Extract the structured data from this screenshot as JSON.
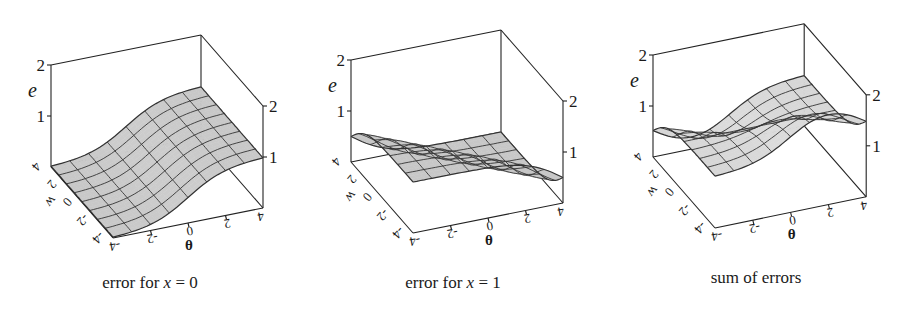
{
  "figure": {
    "panels": [
      {
        "caption_prefix": "error for ",
        "caption_var": "x",
        "caption_suffix": " = 0"
      },
      {
        "caption_prefix": "error for ",
        "caption_var": "x",
        "caption_suffix": " = 1"
      },
      {
        "caption_prefix": "sum of errors",
        "caption_var": "",
        "caption_suffix": ""
      }
    ]
  },
  "chart_data": [
    {
      "type": "surface",
      "title": "error for x = 0",
      "xlabel": "θ",
      "ylabel": "w",
      "zlabel": "e",
      "x_ticks": [
        -4,
        -2,
        0,
        2,
        4
      ],
      "y_ticks": [
        -4,
        -2,
        0,
        2,
        4
      ],
      "z_ticks": [
        1,
        2
      ],
      "xlim": [
        -4,
        4
      ],
      "ylim": [
        -4,
        4
      ],
      "zlim": [
        0,
        2
      ],
      "grid_lines": 9,
      "function": "e = 1/(1+exp(-theta)) (depends on θ only; ~0 at θ=-4, ~1 at θ=4)",
      "origin": [
        113,
        238
      ],
      "theta_vec": [
        18.75,
        -3.75
      ],
      "w_vec": [
        -7.75,
        -8.875
      ],
      "e_vec": [
        0,
        -51
      ],
      "surface_fill": "#c4c4c4"
    },
    {
      "type": "surface",
      "title": "error for x = 1",
      "xlabel": "θ",
      "ylabel": "w",
      "zlabel": "e",
      "x_ticks": [
        -4,
        -2,
        0,
        2,
        4
      ],
      "y_ticks": [
        -4,
        -2,
        0,
        2,
        4
      ],
      "z_ticks": [
        1,
        2
      ],
      "xlim": [
        -4,
        4
      ],
      "ylim": [
        -4,
        4
      ],
      "zlim": [
        0,
        2
      ],
      "grid_lines": 9,
      "function": "e = 1 - 1/(1+exp(-(w+theta))) (~1 at w+θ=-8, ~0 at w+θ=8)",
      "origin": [
        413,
        233
      ],
      "theta_vec": [
        18.75,
        -3.75
      ],
      "w_vec": [
        -7.75,
        -8.875
      ],
      "e_vec": [
        0,
        -51
      ],
      "surface_fill": "#c8c8c8"
    },
    {
      "type": "surface",
      "title": "sum of errors",
      "xlabel": "θ",
      "ylabel": "w",
      "zlabel": "e",
      "x_ticks": [
        -4,
        -2,
        0,
        2,
        4
      ],
      "y_ticks": [
        -4,
        -2,
        0,
        2,
        4
      ],
      "z_ticks": [
        1,
        2
      ],
      "xlim": [
        -4,
        4
      ],
      "ylim": [
        -4,
        4
      ],
      "zlim": [
        0,
        2
      ],
      "grid_lines": 9,
      "function": "e = σ(θ) + 1 - σ(w+θ); ranges ~0 to ~2, peak near θ=4,w=-4 region",
      "origin": [
        715,
        228
      ],
      "theta_vec": [
        18.9,
        -3.9
      ],
      "w_vec": [
        -7.75,
        -8.875
      ],
      "e_vec": [
        0,
        -51
      ],
      "surface_fill": "#d6d6d6"
    }
  ]
}
